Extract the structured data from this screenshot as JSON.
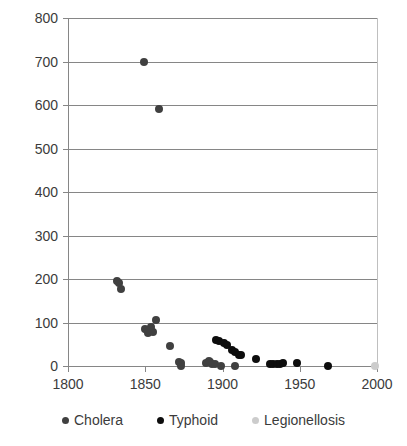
{
  "chart_data": {
    "type": "scatter",
    "title": "",
    "subtitle": "",
    "xlabel": "",
    "ylabel": "",
    "xlim": [
      1800,
      2000
    ],
    "ylim": [
      0,
      800
    ],
    "xticks": [
      1800,
      1850,
      1900,
      1950,
      2000
    ],
    "yticks": [
      0,
      100,
      200,
      300,
      400,
      500,
      600,
      700,
      800
    ],
    "xtick_labels": [
      "1800",
      "1850",
      "1900",
      "1950",
      "2000"
    ],
    "ytick_labels": [
      "0",
      "100",
      "200",
      "300",
      "400",
      "500",
      "600",
      "700",
      "800"
    ],
    "grid": "horizontal",
    "legend_position": "bottom",
    "colors": {
      "cholera": "#404040",
      "typhoid": "#0d0d0d",
      "legionellosis": "#cccccc",
      "gridline": "#868686",
      "axis": "#868686",
      "text": "#3b3b3b",
      "background": "#ffffff"
    },
    "series": [
      {
        "name": "Cholera",
        "color": "#404040",
        "marker": "circle",
        "points": [
          {
            "x": 1832,
            "y": 195
          },
          {
            "x": 1833,
            "y": 191
          },
          {
            "x": 1834,
            "y": 178
          },
          {
            "x": 1849,
            "y": 700
          },
          {
            "x": 1850,
            "y": 86
          },
          {
            "x": 1851,
            "y": 82
          },
          {
            "x": 1852,
            "y": 75
          },
          {
            "x": 1854,
            "y": 90
          },
          {
            "x": 1854,
            "y": 80
          },
          {
            "x": 1855,
            "y": 78
          },
          {
            "x": 1857,
            "y": 105
          },
          {
            "x": 1859,
            "y": 590
          },
          {
            "x": 1866,
            "y": 46
          },
          {
            "x": 1872,
            "y": 10
          },
          {
            "x": 1873,
            "y": 8
          },
          {
            "x": 1873,
            "y": 0
          },
          {
            "x": 1889,
            "y": 8
          },
          {
            "x": 1891,
            "y": 11
          },
          {
            "x": 1892,
            "y": 9
          },
          {
            "x": 1893,
            "y": 4
          },
          {
            "x": 1895,
            "y": 4
          },
          {
            "x": 1899,
            "y": 0
          },
          {
            "x": 1908,
            "y": 0
          }
        ]
      },
      {
        "name": "Typhoid",
        "color": "#0d0d0d",
        "marker": "circle",
        "points": [
          {
            "x": 1896,
            "y": 60
          },
          {
            "x": 1898,
            "y": 57
          },
          {
            "x": 1901,
            "y": 52
          },
          {
            "x": 1903,
            "y": 49
          },
          {
            "x": 1906,
            "y": 36
          },
          {
            "x": 1908,
            "y": 32
          },
          {
            "x": 1911,
            "y": 26
          },
          {
            "x": 1912,
            "y": 25
          },
          {
            "x": 1922,
            "y": 17
          },
          {
            "x": 1931,
            "y": 5
          },
          {
            "x": 1933,
            "y": 4
          },
          {
            "x": 1935,
            "y": 4
          },
          {
            "x": 1937,
            "y": 5
          },
          {
            "x": 1939,
            "y": 6
          },
          {
            "x": 1948,
            "y": 6
          },
          {
            "x": 1968,
            "y": 0
          }
        ]
      },
      {
        "name": "Legionellosis",
        "color": "#cccccc",
        "marker": "circle",
        "points": [
          {
            "x": 1999,
            "y": 0
          }
        ]
      }
    ]
  },
  "legend": {
    "items": [
      {
        "label": "Cholera",
        "color": "#404040"
      },
      {
        "label": "Typhoid",
        "color": "#0d0d0d"
      },
      {
        "label": "Legionellosis",
        "color": "#cccccc"
      }
    ]
  }
}
